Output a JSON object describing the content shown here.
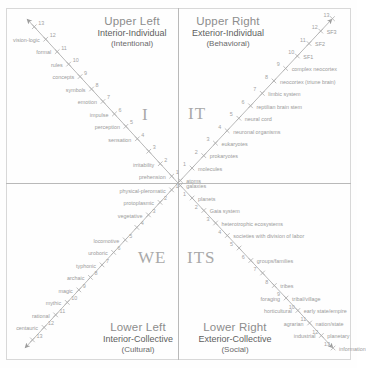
{
  "quadrants": {
    "upper_left": {
      "position": "Upper Left",
      "dimension": "Interior-Individual",
      "aspect": "(Intentional)",
      "pronoun": "I"
    },
    "upper_right": {
      "position": "Upper Right",
      "dimension": "Exterior-Individual",
      "aspect": "(Behavioral)",
      "pronoun": "IT"
    },
    "lower_left": {
      "position": "Lower Left",
      "dimension": "Interior-Collective",
      "aspect": "(Cultural)",
      "pronoun": "WE"
    },
    "lower_right": {
      "position": "Lower Right",
      "dimension": "Exterior-Collective",
      "aspect": "(Social)",
      "pronoun": "ITS"
    }
  },
  "colors": {
    "axis": "#b0b0b0",
    "label_text": "#9a9a9a",
    "heading_primary": "#8d8d8d",
    "heading_secondary": "#5f5f5f",
    "pronoun": "#a9a9a9",
    "background": "#fefefe"
  },
  "chart_data": {
    "type": "scatter",
    "xlabel": "",
    "ylabel": "",
    "axes": [
      {
        "name": "upper-left-axis",
        "quadrant": "Upper Left",
        "direction": "up-left",
        "points": [
          {
            "n": "1",
            "label": "prehension"
          },
          {
            "n": "2",
            "label": "irritability"
          },
          {
            "n": "3",
            "label": ""
          },
          {
            "n": "4",
            "label": "sensation"
          },
          {
            "n": "5",
            "label": "perception"
          },
          {
            "n": "6",
            "label": "impulse"
          },
          {
            "n": "7",
            "label": "emotion"
          },
          {
            "n": "8",
            "label": "symbols"
          },
          {
            "n": "9",
            "label": "concepts"
          },
          {
            "n": "10",
            "label": "rules"
          },
          {
            "n": "11",
            "label": "formal"
          },
          {
            "n": "12",
            "label": "vision-logic"
          },
          {
            "n": "13",
            "label": ""
          }
        ]
      },
      {
        "name": "upper-right-axis",
        "quadrant": "Upper Right",
        "direction": "up-right",
        "points": [
          {
            "n": "",
            "label": "atoms"
          },
          {
            "n": "1",
            "label": "molecules"
          },
          {
            "n": "2",
            "label": "prokaryotes"
          },
          {
            "n": "3",
            "label": "eukaryotes"
          },
          {
            "n": "4",
            "label": "neuronal organisms"
          },
          {
            "n": "5",
            "label": "neural cord"
          },
          {
            "n": "6",
            "label": "reptilian brain stem"
          },
          {
            "n": "7",
            "label": "limbic system"
          },
          {
            "n": "8",
            "label": "neocortex (triune brain)"
          },
          {
            "n": "9",
            "label": "complex neocortex"
          },
          {
            "n": "10",
            "label": "SF1"
          },
          {
            "n": "11",
            "label": "SF2"
          },
          {
            "n": "12",
            "label": "SF3"
          },
          {
            "n": "13",
            "label": ""
          }
        ]
      },
      {
        "name": "lower-left-axis",
        "quadrant": "Lower Left",
        "direction": "down-left",
        "points": [
          {
            "n": "1",
            "label": "physical-pleromatic"
          },
          {
            "n": "2",
            "label": "protoplasmic"
          },
          {
            "n": "3",
            "label": "vegetative"
          },
          {
            "n": "4",
            "label": ""
          },
          {
            "n": "5",
            "label": "locomotive"
          },
          {
            "n": "6",
            "label": "uroboric"
          },
          {
            "n": "7",
            "label": "typhonic"
          },
          {
            "n": "8",
            "label": "archaic"
          },
          {
            "n": "9",
            "label": "magic"
          },
          {
            "n": "10",
            "label": "mythic"
          },
          {
            "n": "11",
            "label": "rational"
          },
          {
            "n": "12",
            "label": "centauric"
          },
          {
            "n": "13",
            "label": ""
          }
        ]
      },
      {
        "name": "lower-right-axis",
        "quadrant": "Lower Right",
        "direction": "down-right",
        "points": [
          {
            "n": "",
            "label": "galaxies"
          },
          {
            "n": "1",
            "label": "planets"
          },
          {
            "n": "2",
            "label": "Gaia system"
          },
          {
            "n": "3",
            "label": "heterotrophic ecosystems"
          },
          {
            "n": "4",
            "label": "societies with division of labor"
          },
          {
            "n": "5",
            "label": ""
          },
          {
            "n": "6",
            "label": "groups/families"
          },
          {
            "n": "7",
            "label": ""
          },
          {
            "n": "8",
            "label": "tribes"
          },
          {
            "n": "9",
            "label": "foraging",
            "label2": "tribal/village"
          },
          {
            "n": "10",
            "label": "horticultural",
            "label2": "early state/empire"
          },
          {
            "n": "11",
            "label": "agrarian",
            "label2": "nation/state"
          },
          {
            "n": "12",
            "label": "industrial",
            "label2": "planetary"
          },
          {
            "n": "13",
            "label": "information"
          }
        ]
      }
    ]
  }
}
